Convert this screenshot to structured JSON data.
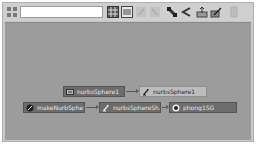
{
  "window": {
    "type": "Hypergraph / Hypershade node graph"
  },
  "toolbar": {
    "search": {
      "value": "",
      "placeholder": ""
    },
    "buttons": [
      {
        "name": "grid-view-button",
        "icon": "grid-icon",
        "enabled": true
      },
      {
        "name": "list-view-button",
        "icon": "list-icon",
        "enabled": true
      },
      {
        "name": "graph-input-button",
        "icon": "graph-input-icon",
        "enabled": false
      },
      {
        "name": "graph-output-button",
        "icon": "graph-output-icon",
        "enabled": false
      },
      {
        "name": "show-connections-button",
        "icon": "connections-icon",
        "enabled": true
      },
      {
        "name": "input-output-button",
        "icon": "input-output-icon",
        "enabled": true
      },
      {
        "name": "rearrange-graph-button",
        "icon": "rearrange-icon",
        "enabled": true
      },
      {
        "name": "edit-node-button",
        "icon": "edit-icon",
        "enabled": true
      },
      {
        "name": "clear-graph-button",
        "icon": "clear-icon",
        "enabled": false
      }
    ]
  },
  "graph": {
    "nodes": [
      {
        "id": "n1",
        "label": "nurbsSphere1_",
        "icon": "transform-icon",
        "style": "dark"
      },
      {
        "id": "n2",
        "label": "nurbsSphere1",
        "icon": "nurbs-shape-icon",
        "style": "light"
      },
      {
        "id": "n3",
        "label": "makeNurbSphe...",
        "icon": "make-nurbs-icon",
        "style": "dark"
      },
      {
        "id": "n4",
        "label": "nurbsSphereSh...",
        "icon": "nurbs-shape-icon",
        "style": "dark"
      },
      {
        "id": "n5",
        "label": "phong1SG",
        "icon": "shading-group-icon",
        "style": "dark"
      }
    ],
    "edges": [
      {
        "from": "n1",
        "to": "n2"
      },
      {
        "from": "n3",
        "to": "n4"
      },
      {
        "from": "n4",
        "to": "n5"
      }
    ]
  },
  "colors": {
    "canvas": "#9c9c9c",
    "toolbar": "#cfcfcf",
    "node_dark": "#6c6c6c",
    "node_light": "#bdbdbd"
  }
}
